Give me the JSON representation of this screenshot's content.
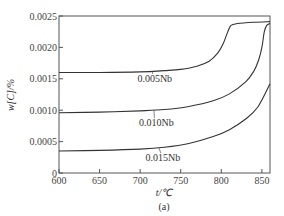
{
  "chart_data": {
    "type": "line",
    "title": "",
    "caption": "(a)",
    "xlabel": "t/℃",
    "ylabel": "w[C]/%",
    "xlim": [
      600,
      860
    ],
    "ylim": [
      0,
      0.0025
    ],
    "xticks": [
      600,
      650,
      700,
      750,
      800,
      850
    ],
    "yticks": [
      0,
      0.0005,
      0.001,
      0.0015,
      0.002,
      0.0025
    ],
    "ytick_labels": [
      "0",
      "0.0005",
      "0.0010",
      "0.0015",
      "0.0020",
      "0.0025"
    ],
    "xtick_labels": [
      "600",
      "650",
      "700",
      "750",
      "800",
      "850"
    ],
    "grid": false,
    "legend": "inline labels",
    "series": [
      {
        "name": "0.005Nb",
        "x": [
          600,
          650,
          700,
          730,
          750,
          770,
          785,
          795,
          802,
          808,
          812,
          820,
          840,
          860
        ],
        "y": [
          0.0016,
          0.0016,
          0.00161,
          0.00163,
          0.00165,
          0.0017,
          0.00178,
          0.0019,
          0.00205,
          0.00225,
          0.00235,
          0.00238,
          0.0024,
          0.00241
        ]
      },
      {
        "name": "0.010Nb",
        "x": [
          600,
          650,
          700,
          730,
          760,
          790,
          810,
          830,
          840,
          846,
          850,
          853,
          856,
          860
        ],
        "y": [
          0.00096,
          0.00097,
          0.00099,
          0.00101,
          0.00106,
          0.00115,
          0.00126,
          0.00145,
          0.00162,
          0.0018,
          0.002,
          0.00225,
          0.00235,
          0.00238
        ]
      },
      {
        "name": "0.015Nb",
        "x": [
          600,
          650,
          700,
          730,
          760,
          790,
          810,
          830,
          845,
          860
        ],
        "y": [
          0.00035,
          0.00036,
          0.00038,
          0.00041,
          0.00047,
          0.00058,
          0.00069,
          0.00086,
          0.00105,
          0.00142
        ]
      }
    ],
    "annotations": [
      {
        "text": "0.005Nb",
        "x": 718,
        "y": 0.00145,
        "leader_to": [
          715,
          0.00162
        ]
      },
      {
        "text": "0.010Nb",
        "x": 720,
        "y": 0.00075,
        "leader_to": [
          717,
          0.001
        ]
      },
      {
        "text": "0.015Nb",
        "x": 728,
        "y": 0.00019,
        "leader_to": [
          723,
          0.0004
        ]
      }
    ]
  }
}
